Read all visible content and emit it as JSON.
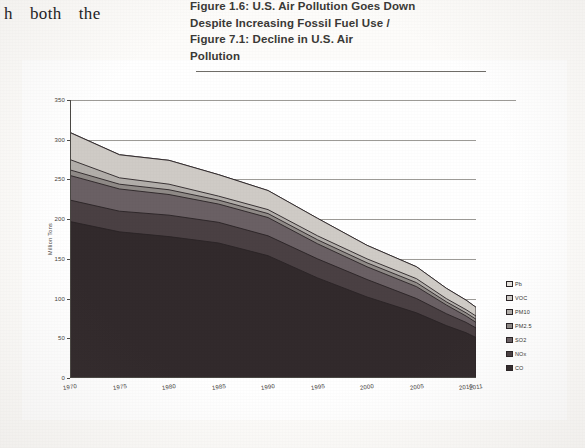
{
  "page": {
    "body_text_words": [
      "h",
      "both",
      "the"
    ],
    "section_number": "6.10.3"
  },
  "caption": {
    "lines": [
      "Figure 1.6: U.S. Air Pollution Goes Down",
      "Despite Increasing Fossil Fuel Use /",
      "Figure 7.1: Decline in U.S. Air",
      "Pollution"
    ]
  },
  "chart_data": {
    "type": "area",
    "title": "Figure 7.1: Decline in U.S. Air Pollution",
    "xlabel": "",
    "ylabel": "Million Tons",
    "ylim": [
      0,
      350
    ],
    "xlim": [
      1970,
      2011
    ],
    "grid": true,
    "legend_position": "right",
    "ytick_labels": [
      "0",
      "50",
      "100",
      "150",
      "200",
      "250",
      "300",
      "350"
    ],
    "ytick_values": [
      0,
      50,
      100,
      150,
      200,
      250,
      300,
      350
    ],
    "xtick_labels": [
      "1970",
      "1975",
      "1980",
      "1985",
      "1990",
      "1995",
      "2000",
      "2005",
      "2010",
      "2011"
    ],
    "xtick_values": [
      1970,
      1975,
      1980,
      1985,
      1990,
      1995,
      2000,
      2005,
      2010,
      2011
    ],
    "x": [
      1970,
      1975,
      1980,
      1985,
      1990,
      1995,
      2000,
      2005,
      2008,
      2010,
      2011
    ],
    "series": [
      {
        "name": "CO",
        "color": "#322a2c",
        "values": [
          197,
          184,
          178,
          170,
          154,
          126,
          102,
          82,
          66,
          57,
          51
        ]
      },
      {
        "name": "NOx",
        "color": "#4a4043",
        "values": [
          27,
          26,
          27,
          26,
          25,
          24,
          22,
          18,
          15,
          13,
          12
        ]
      },
      {
        "name": "SO2",
        "color": "#6a6064",
        "values": [
          31,
          28,
          26,
          23,
          23,
          19,
          16,
          15,
          11,
          8,
          7
        ]
      },
      {
        "name": "PM2.5",
        "color": "#8f8a87",
        "values": [
          7,
          6,
          6,
          5,
          5,
          5,
          5,
          5,
          4,
          4,
          4
        ]
      },
      {
        "name": "PM10",
        "color": "#b2aeaa",
        "values": [
          13,
          8,
          7,
          5,
          5,
          5,
          5,
          5,
          4,
          4,
          4
        ]
      },
      {
        "name": "VOC",
        "color": "#cfcbc6",
        "values": [
          34,
          29,
          30,
          27,
          24,
          22,
          17,
          15,
          13,
          12,
          11
        ]
      },
      {
        "name": "Pb",
        "color": "#e6e3de",
        "values": [
          0.22,
          0.16,
          0.07,
          0.02,
          0.01,
          0.01,
          0.01,
          0.01,
          0.01,
          0.01,
          0.01
        ]
      }
    ],
    "legend_entries": [
      {
        "label": "Pb",
        "color": "#e6e3de"
      },
      {
        "label": "VOC",
        "color": "#cfcbc6"
      },
      {
        "label": "PM10",
        "color": "#b2aeaa"
      },
      {
        "label": "PM2.5",
        "color": "#8f8a87"
      },
      {
        "label": "SO2",
        "color": "#6a6064"
      },
      {
        "label": "NOx",
        "color": "#4a4043"
      },
      {
        "label": "CO",
        "color": "#322a2c"
      }
    ]
  }
}
